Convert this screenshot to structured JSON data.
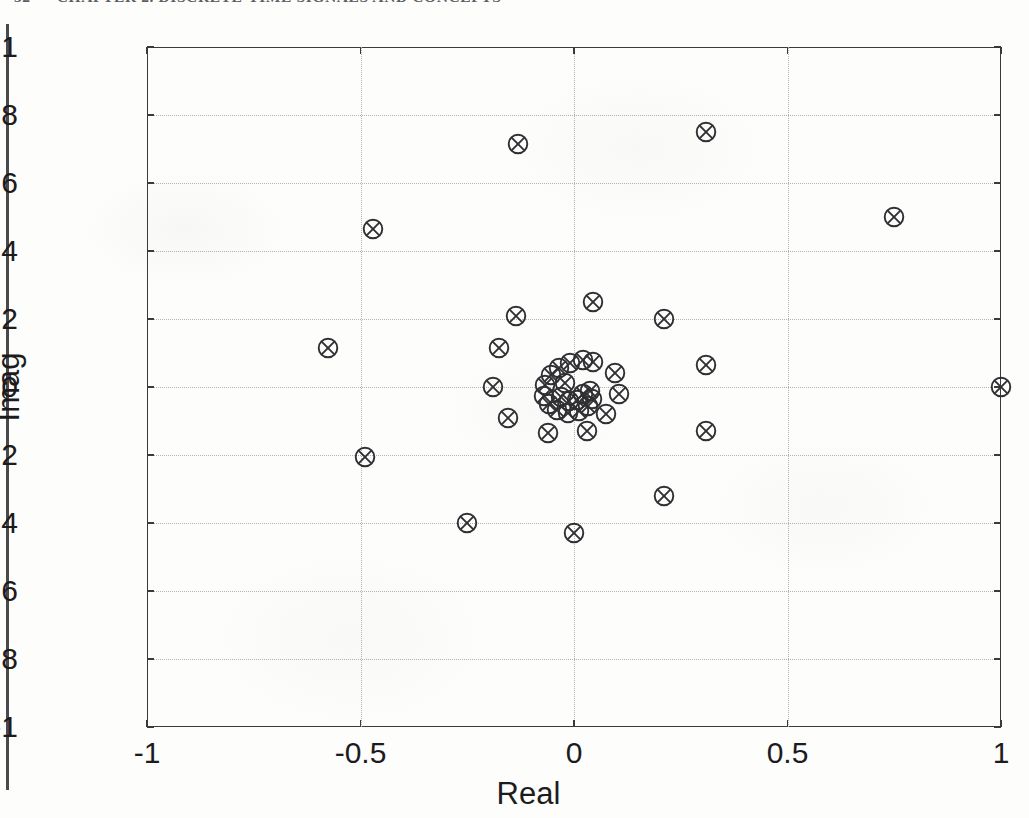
{
  "page": {
    "header_number": "52",
    "header_title": "CHAPTER 2. DISCRETE-TIME SIGNALS AND CONCEPTS",
    "binding_edge": "binding-edge"
  },
  "chart_data": {
    "type": "scatter",
    "title": "",
    "xlabel": "Real",
    "ylabel": "Imag",
    "xlim": [
      -1,
      1
    ],
    "ylim": [
      -1,
      1
    ],
    "grid": true,
    "legend": null,
    "marker": "circle-x",
    "marker_color": "#303034",
    "xticks": [
      "-1",
      "-0.5",
      "0",
      "0.5",
      "1"
    ],
    "xtick_values": [
      -1,
      -0.5,
      0,
      0.5,
      1
    ],
    "yticks": [
      "1",
      "0.8",
      "0.6",
      "0.4",
      "0.2",
      "0",
      "-0.2",
      "-0.4",
      "-0.6",
      "-0.8",
      "-1"
    ],
    "ytick_values": [
      1,
      0.8,
      0.6,
      0.4,
      0.2,
      0,
      -0.2,
      -0.4,
      -0.6,
      -0.8,
      -1
    ],
    "gridline_x": [
      -0.5,
      0,
      0.5
    ],
    "gridline_y": [
      0.8,
      0.6,
      0.4,
      0.2,
      0,
      -0.2,
      -0.4,
      -0.6,
      -0.8
    ],
    "points": [
      [
        -0.13,
        0.715
      ],
      [
        0.31,
        0.75
      ],
      [
        -0.47,
        0.465
      ],
      [
        0.75,
        0.5
      ],
      [
        -0.575,
        0.115
      ],
      [
        -0.135,
        0.21
      ],
      [
        0.045,
        0.25
      ],
      [
        0.21,
        0.2
      ],
      [
        -0.175,
        0.115
      ],
      [
        0.31,
        0.065
      ],
      [
        -0.19,
        0.0
      ],
      [
        1.0,
        0.0
      ],
      [
        -0.155,
        -0.09
      ],
      [
        0.095,
        0.04
      ],
      [
        0.105,
        -0.02
      ],
      [
        0.075,
        -0.08
      ],
      [
        -0.06,
        -0.135
      ],
      [
        0.03,
        -0.13
      ],
      [
        0.31,
        -0.13
      ],
      [
        -0.49,
        -0.205
      ],
      [
        0.21,
        -0.32
      ],
      [
        -0.25,
        -0.4
      ],
      [
        0.0,
        -0.43
      ],
      [
        -0.055,
        0.035
      ],
      [
        -0.035,
        0.055
      ],
      [
        -0.01,
        0.07
      ],
      [
        0.02,
        0.08
      ],
      [
        0.045,
        0.075
      ],
      [
        -0.068,
        0.005
      ],
      [
        -0.07,
        -0.025
      ],
      [
        -0.058,
        -0.05
      ],
      [
        -0.04,
        -0.068
      ],
      [
        -0.015,
        -0.075
      ],
      [
        0.012,
        -0.07
      ],
      [
        0.032,
        -0.055
      ],
      [
        0.042,
        -0.035
      ],
      [
        0.038,
        -0.012
      ],
      [
        -0.03,
        -0.03
      ],
      [
        -0.012,
        -0.04
      ],
      [
        0.008,
        -0.038
      ],
      [
        0.022,
        -0.022
      ],
      [
        -0.022,
        0.012
      ]
    ]
  }
}
